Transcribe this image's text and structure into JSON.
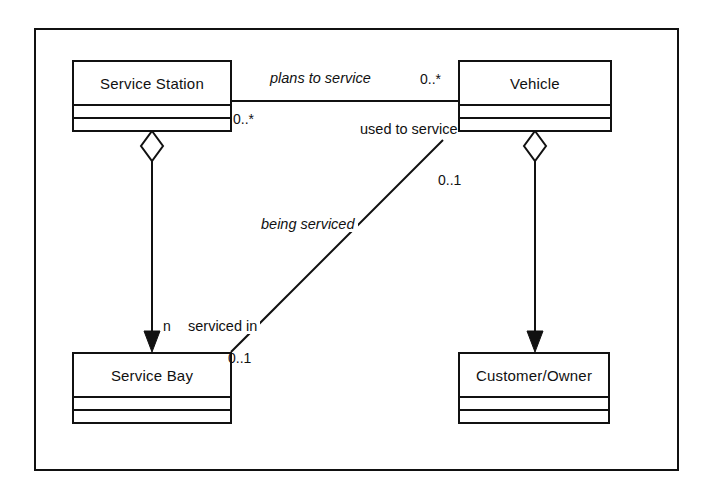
{
  "diagram": {
    "kind": "uml-class-diagram",
    "frame": {
      "stroke": "#111111"
    },
    "background_color": "#ffffff",
    "line_color": "#111111",
    "classes": [
      {
        "id": "service-station",
        "name": "Service Station",
        "compartments": 3
      },
      {
        "id": "vehicle",
        "name": "Vehicle",
        "compartments": 3
      },
      {
        "id": "service-bay",
        "name": "Service Bay",
        "compartments": 3
      },
      {
        "id": "customer-owner",
        "name": "Customer/Owner",
        "compartments": 3
      }
    ],
    "associations": [
      {
        "id": "plans-to-service",
        "label": "plans to service",
        "italic": true,
        "from": "service-station",
        "to": "vehicle",
        "from_multiplicity": "0..*",
        "to_multiplicity": "0..*"
      },
      {
        "id": "used-to-service",
        "label": "used to service",
        "italic": false,
        "from": "vehicle",
        "to": "service-bay",
        "from_multiplicity": "0..1",
        "to_multiplicity": "0..1"
      },
      {
        "id": "being-serviced",
        "label": "being serviced",
        "italic": true,
        "from": "vehicle",
        "to": "service-bay",
        "from_multiplicity": "0..1",
        "to_multiplicity": "0..1"
      },
      {
        "id": "serviced-in",
        "label": "serviced in",
        "italic": false,
        "from": "service-bay",
        "to": "vehicle",
        "from_multiplicity": "0..1",
        "to_multiplicity": "0..1"
      }
    ],
    "aggregations": [
      {
        "id": "station-bay",
        "whole": "service-station",
        "part": "service-bay",
        "multiplicity": "n",
        "diamond": "hollow",
        "arrow": "filled"
      },
      {
        "id": "vehicle-customer",
        "whole": "vehicle",
        "part": "customer-owner",
        "multiplicity": "",
        "diamond": "hollow",
        "arrow": "filled"
      }
    ],
    "labels": {
      "plans_to_service": "plans to service",
      "used_to_service": "used to service",
      "being_serviced": "being serviced",
      "serviced_in": "serviced in",
      "mult_station_right": "0..*",
      "mult_vehicle_left": "0..*",
      "mult_vehicle_down": "0..1",
      "mult_bay_right": "0..1",
      "mult_bay_n": "n"
    },
    "class_names": {
      "service_station": "Service Station",
      "vehicle": "Vehicle",
      "service_bay": "Service Bay",
      "customer_owner": "Customer/Owner"
    }
  }
}
